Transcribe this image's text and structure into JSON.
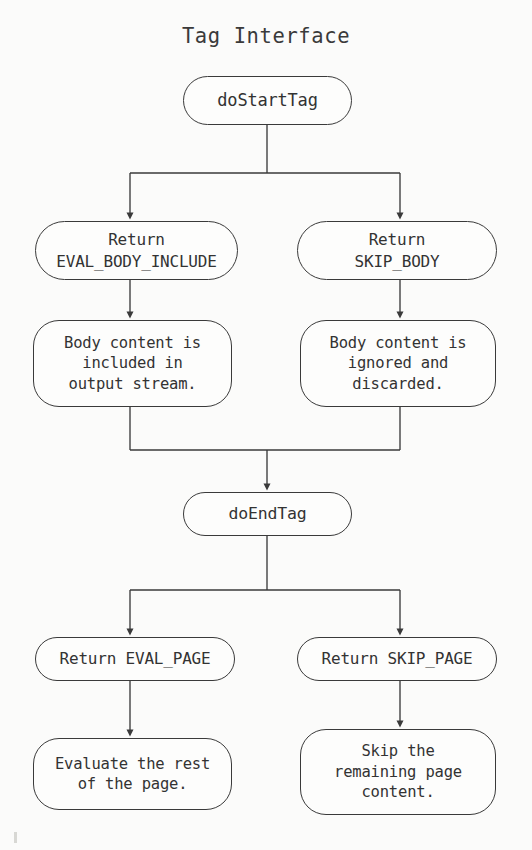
{
  "title": "Tag Interface",
  "colors": {
    "background": "#fbfbfa",
    "stroke": "#3a3a3a",
    "text": "#333333",
    "node_fill": "#fdfdfc"
  },
  "nodes": {
    "do_start_tag": "doStartTag",
    "return_eval_body_include": "Return\nEVAL_BODY_INCLUDE",
    "return_skip_body": "Return\nSKIP_BODY",
    "body_included": "Body content is\nincluded in\noutput stream.",
    "body_ignored": "Body content is\nignored and\ndiscarded.",
    "do_end_tag": "doEndTag",
    "return_eval_page": "Return EVAL_PAGE",
    "return_skip_page": "Return SKIP_PAGE",
    "evaluate_rest": "Evaluate the rest\nof the page.",
    "skip_remaining": "Skip the\nremaining page\ncontent."
  },
  "flow": {
    "edges": [
      {
        "from": "do_start_tag",
        "to": "return_eval_body_include"
      },
      {
        "from": "do_start_tag",
        "to": "return_skip_body"
      },
      {
        "from": "return_eval_body_include",
        "to": "body_included"
      },
      {
        "from": "return_skip_body",
        "to": "body_ignored"
      },
      {
        "from": "body_included",
        "to": "do_end_tag"
      },
      {
        "from": "body_ignored",
        "to": "do_end_tag"
      },
      {
        "from": "do_end_tag",
        "to": "return_eval_page"
      },
      {
        "from": "do_end_tag",
        "to": "return_skip_page"
      },
      {
        "from": "return_eval_page",
        "to": "evaluate_rest"
      },
      {
        "from": "return_skip_page",
        "to": "skip_remaining"
      }
    ]
  }
}
